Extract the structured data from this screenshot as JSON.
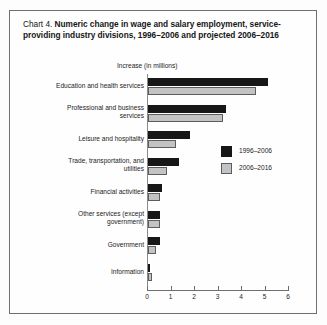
{
  "title": {
    "lead": "Chart 4. ",
    "strong": "Numeric change in wage and salary employment, service-providing industry divisions, 1996–2006 and projected 2006–2016"
  },
  "axis_caption": "Increase (in millions)",
  "legend": {
    "items": [
      {
        "label": "1996–2006",
        "color": "#171717"
      },
      {
        "label": "2006–2016",
        "color": "#c3c3c3"
      }
    ]
  },
  "xaxis": {
    "ticks": [
      "0",
      "1",
      "2",
      "3",
      "4",
      "5",
      "6"
    ]
  },
  "categories": [
    "Education and health services",
    "Professional and business services",
    "Leisure and hospitality",
    "Trade, transportation, and utilities",
    "Financial activities",
    "Other services (except government)",
    "Government",
    "Information"
  ],
  "chart_data": {
    "type": "bar",
    "orientation": "horizontal",
    "title": "Chart 4. Numeric change in wage and salary employment, service-providing industry divisions, 1996–2006 and projected 2006–2016",
    "xlabel": "Increase (in millions)",
    "ylabel": "",
    "xlim": [
      0,
      6
    ],
    "xticks": [
      0,
      1,
      2,
      3,
      4,
      5,
      6
    ],
    "grid": false,
    "legend_position": "center-right",
    "categories": [
      "Education and health services",
      "Professional and business services",
      "Leisure and hospitality",
      "Trade, transportation, and utilities",
      "Financial activities",
      "Other services (except government)",
      "Government",
      "Information"
    ],
    "series": [
      {
        "name": "1996–2006",
        "color": "#171717",
        "values": [
          5.1,
          3.3,
          1.8,
          1.3,
          0.6,
          0.5,
          0.5,
          0.1
        ]
      },
      {
        "name": "2006–2016",
        "color": "#c3c3c3",
        "values": [
          4.6,
          3.2,
          1.2,
          0.8,
          0.5,
          0.5,
          0.35,
          0.15
        ]
      }
    ]
  }
}
